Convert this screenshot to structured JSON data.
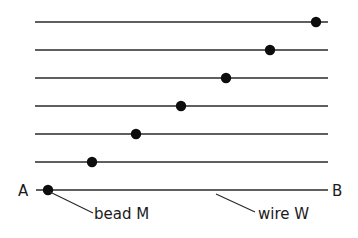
{
  "diagram": {
    "colors": {
      "line": "#2a2a2a",
      "bead": "#0d0d0d",
      "text": "#1a1a1a",
      "background": "#ffffff"
    },
    "wires": [
      {
        "y": 22,
        "x1": 35,
        "x2": 328,
        "bead_x": 316
      },
      {
        "y": 50,
        "x1": 35,
        "x2": 328,
        "bead_x": 270
      },
      {
        "y": 78,
        "x1": 35,
        "x2": 328,
        "bead_x": 226
      },
      {
        "y": 106,
        "x1": 35,
        "x2": 328,
        "bead_x": 181
      },
      {
        "y": 134,
        "x1": 35,
        "x2": 328,
        "bead_x": 136
      },
      {
        "y": 162,
        "x1": 35,
        "x2": 328,
        "bead_x": 92
      },
      {
        "y": 190,
        "x1": 36,
        "x2": 328,
        "bead_x": 48
      }
    ],
    "labels": {
      "end_a": "A",
      "end_b": "B",
      "bead": "bead M",
      "wire": "wire W"
    }
  }
}
